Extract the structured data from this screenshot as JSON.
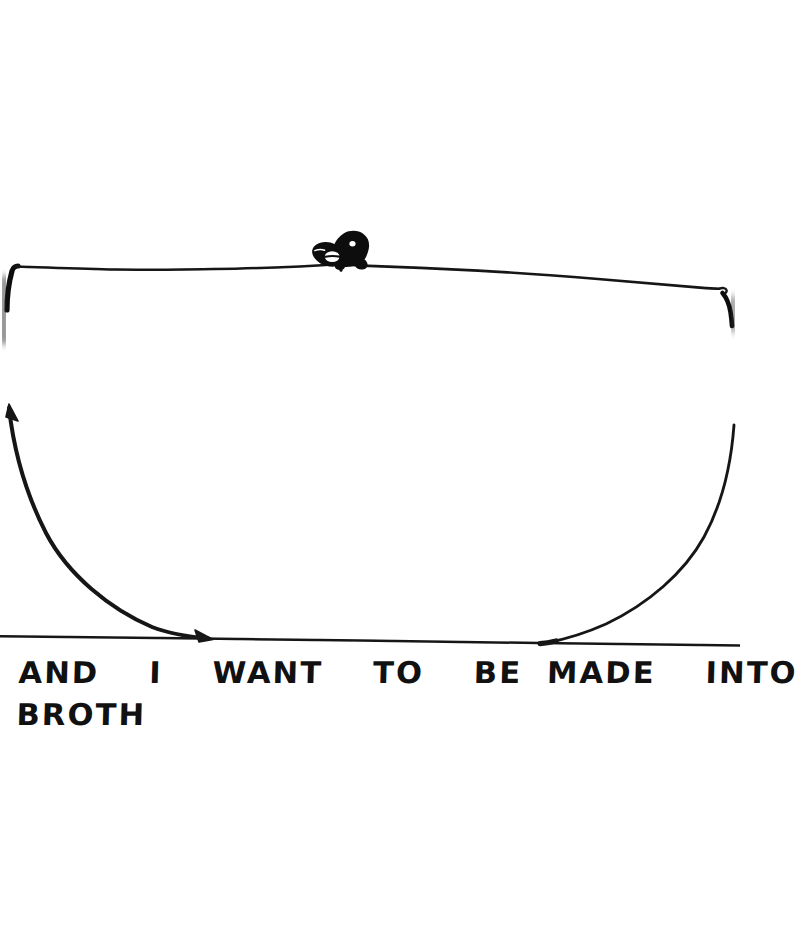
{
  "artwork": {
    "title": "Hand-drawn bowl with creature",
    "medium": "ink-on-paper-scan",
    "background_color": "#ffffff",
    "ink_color": "#111111",
    "canvas": {
      "width": 740,
      "height": 942
    }
  },
  "caption": {
    "full_text": "AND I WANT TO BE MADE INTO BROTH",
    "line_1": "AND  I  WANT  TO  BE MADE  INTO",
    "line_2": "BROTH",
    "style": "hand-lettered-block-capitals"
  },
  "elements": {
    "bowl_rim": {
      "name": "bowl-rim-line",
      "description": "near-horizontal wavering ink line forming the rim of a bowl",
      "start": {
        "x": 10,
        "y": 266
      },
      "end": {
        "x": 728,
        "y": 292
      }
    },
    "bowl_left_wall": {
      "name": "bowl-left-wall",
      "description": "concave curve descending from upper-left with arrowhead tip down to the table line",
      "start": {
        "x": 9,
        "y": 406
      },
      "end": {
        "x": 210,
        "y": 638
      },
      "has_arrowhead": true
    },
    "bowl_right_wall": {
      "name": "bowl-right-wall",
      "description": "concave curve descending from upper-right down to the table line",
      "start": {
        "x": 736,
        "y": 424
      },
      "end": {
        "x": 546,
        "y": 642
      },
      "has_arrowhead": false
    },
    "table_line": {
      "name": "table-surface-line",
      "description": "full-width horizontal ink line the bowl rests on",
      "start": {
        "x": 0,
        "y": 636
      },
      "end": {
        "x": 740,
        "y": 646
      }
    },
    "creature": {
      "name": "creature-on-rim",
      "description": "small solid-black animal head with pointed snout facing left, white eye and white round mouth, perched on the bowl rim",
      "position": {
        "x": 310,
        "y": 230,
        "width": 62,
        "height": 38
      }
    },
    "smudges": [
      {
        "name": "left-edge-ink-smudge",
        "description": "faded blurred ink stroke at the left page edge below the rim",
        "position": {
          "x": 0,
          "y": 276,
          "width": 18,
          "height": 70
        }
      },
      {
        "name": "right-edge-ink-smudge",
        "description": "faded blurred ink stroke at the right page edge below the rim",
        "position": {
          "x": 722,
          "y": 296,
          "width": 18,
          "height": 34
        }
      }
    ]
  }
}
